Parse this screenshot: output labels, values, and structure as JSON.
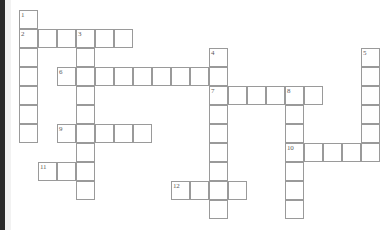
{
  "puzzle": {
    "kind": "crossword-grid",
    "title": "",
    "cell_size": 19,
    "origin_x": 19,
    "origin_y": 10,
    "colors": {
      "cell_fill": "#ffffff",
      "cell_border": "#9a9a9a",
      "number_text": "#5a5a5a",
      "page_background": "#ffffff",
      "page_edge": "#2b2b2b"
    },
    "counts": {
      "total_cells": 71,
      "total_entries": 12,
      "across_entries": 7,
      "down_entries": 5
    },
    "entries": [
      {
        "number": "1",
        "direction": "down",
        "col": 0,
        "row": 0,
        "length": 7
      },
      {
        "number": "2",
        "direction": "across",
        "col": 0,
        "row": 1,
        "length": 6
      },
      {
        "number": "3",
        "direction": "down",
        "col": 3,
        "row": 1,
        "length": 9
      },
      {
        "number": "4",
        "direction": "down",
        "col": 10,
        "row": 2,
        "length": 9
      },
      {
        "number": "5",
        "direction": "down",
        "col": 18,
        "row": 2,
        "length": 6
      },
      {
        "number": "6",
        "direction": "across",
        "col": 2,
        "row": 3,
        "length": 8
      },
      {
        "number": "7",
        "direction": "across",
        "col": 10,
        "row": 4,
        "length": 6
      },
      {
        "number": "8",
        "direction": "down",
        "col": 14,
        "row": 4,
        "length": 7
      },
      {
        "number": "9",
        "direction": "across",
        "col": 2,
        "row": 6,
        "length": 5
      },
      {
        "number": "10",
        "direction": "across",
        "col": 14,
        "row": 7,
        "length": 4
      },
      {
        "number": "11",
        "direction": "across",
        "col": 1,
        "row": 8,
        "length": 3
      },
      {
        "number": "12",
        "direction": "across",
        "col": 8,
        "row": 9,
        "length": 4
      }
    ],
    "cells": [
      {
        "col": 0,
        "row": 0,
        "number": "1"
      },
      {
        "col": 0,
        "row": 1,
        "number": "2"
      },
      {
        "col": 1,
        "row": 1,
        "number": ""
      },
      {
        "col": 2,
        "row": 1,
        "number": ""
      },
      {
        "col": 3,
        "row": 1,
        "number": "3"
      },
      {
        "col": 4,
        "row": 1,
        "number": ""
      },
      {
        "col": 5,
        "row": 1,
        "number": ""
      },
      {
        "col": 0,
        "row": 2,
        "number": ""
      },
      {
        "col": 3,
        "row": 2,
        "number": ""
      },
      {
        "col": 10,
        "row": 2,
        "number": "4"
      },
      {
        "col": 18,
        "row": 2,
        "number": "5"
      },
      {
        "col": 0,
        "row": 3,
        "number": ""
      },
      {
        "col": 2,
        "row": 3,
        "number": "6"
      },
      {
        "col": 3,
        "row": 3,
        "number": ""
      },
      {
        "col": 4,
        "row": 3,
        "number": ""
      },
      {
        "col": 5,
        "row": 3,
        "number": ""
      },
      {
        "col": 6,
        "row": 3,
        "number": ""
      },
      {
        "col": 7,
        "row": 3,
        "number": ""
      },
      {
        "col": 8,
        "row": 3,
        "number": ""
      },
      {
        "col": 9,
        "row": 3,
        "number": ""
      },
      {
        "col": 10,
        "row": 3,
        "number": ""
      },
      {
        "col": 18,
        "row": 3,
        "number": ""
      },
      {
        "col": 0,
        "row": 4,
        "number": ""
      },
      {
        "col": 3,
        "row": 4,
        "number": ""
      },
      {
        "col": 10,
        "row": 4,
        "number": "7"
      },
      {
        "col": 11,
        "row": 4,
        "number": ""
      },
      {
        "col": 12,
        "row": 4,
        "number": ""
      },
      {
        "col": 13,
        "row": 4,
        "number": ""
      },
      {
        "col": 14,
        "row": 4,
        "number": "8"
      },
      {
        "col": 15,
        "row": 4,
        "number": ""
      },
      {
        "col": 18,
        "row": 4,
        "number": ""
      },
      {
        "col": 0,
        "row": 5,
        "number": ""
      },
      {
        "col": 3,
        "row": 5,
        "number": ""
      },
      {
        "col": 10,
        "row": 5,
        "number": ""
      },
      {
        "col": 14,
        "row": 5,
        "number": ""
      },
      {
        "col": 18,
        "row": 5,
        "number": ""
      },
      {
        "col": 0,
        "row": 6,
        "number": ""
      },
      {
        "col": 2,
        "row": 6,
        "number": "9"
      },
      {
        "col": 3,
        "row": 6,
        "number": ""
      },
      {
        "col": 4,
        "row": 6,
        "number": ""
      },
      {
        "col": 5,
        "row": 6,
        "number": ""
      },
      {
        "col": 6,
        "row": 6,
        "number": ""
      },
      {
        "col": 10,
        "row": 6,
        "number": ""
      },
      {
        "col": 14,
        "row": 6,
        "number": ""
      },
      {
        "col": 18,
        "row": 6,
        "number": ""
      },
      {
        "col": 3,
        "row": 7,
        "number": ""
      },
      {
        "col": 10,
        "row": 7,
        "number": ""
      },
      {
        "col": 14,
        "row": 7,
        "number": "10"
      },
      {
        "col": 15,
        "row": 7,
        "number": ""
      },
      {
        "col": 16,
        "row": 7,
        "number": ""
      },
      {
        "col": 17,
        "row": 7,
        "number": ""
      },
      {
        "col": 18,
        "row": 7,
        "number": ""
      },
      {
        "col": 1,
        "row": 8,
        "number": "11"
      },
      {
        "col": 2,
        "row": 8,
        "number": ""
      },
      {
        "col": 3,
        "row": 8,
        "number": ""
      },
      {
        "col": 10,
        "row": 8,
        "number": ""
      },
      {
        "col": 14,
        "row": 8,
        "number": ""
      },
      {
        "col": 3,
        "row": 9,
        "number": ""
      },
      {
        "col": 8,
        "row": 9,
        "number": "12"
      },
      {
        "col": 9,
        "row": 9,
        "number": ""
      },
      {
        "col": 10,
        "row": 9,
        "number": ""
      },
      {
        "col": 11,
        "row": 9,
        "number": ""
      },
      {
        "col": 14,
        "row": 9,
        "number": ""
      },
      {
        "col": 10,
        "row": 10,
        "number": ""
      },
      {
        "col": 14,
        "row": 10,
        "number": ""
      }
    ]
  }
}
